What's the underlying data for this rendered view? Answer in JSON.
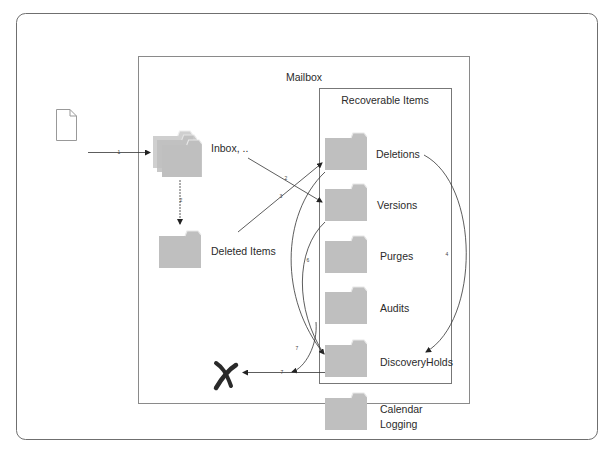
{
  "diagram": {
    "containers": {
      "mailbox": {
        "title": "Mailbox"
      },
      "recoverable_items": {
        "title": "Recoverable Items"
      }
    },
    "nodes": {
      "message": {
        "icon": "document-icon"
      },
      "inbox": {
        "label": "Inbox, ..",
        "icon": "folder-stack-icon"
      },
      "deleted_items": {
        "label": "Deleted Items",
        "icon": "folder-icon"
      },
      "deletions": {
        "label": "Deletions",
        "icon": "folder-icon"
      },
      "versions": {
        "label": "Versions",
        "icon": "folder-icon"
      },
      "purges": {
        "label": "Purges",
        "icon": "folder-icon"
      },
      "audits": {
        "label": "Audits",
        "icon": "folder-icon"
      },
      "discovery_holds": {
        "label": "DiscoveryHolds",
        "icon": "folder-icon"
      },
      "calendar_logging": {
        "label_line1": "Calendar",
        "label_line2": "Logging",
        "icon": "folder-icon"
      },
      "purged": {
        "icon": "x-mark-icon"
      }
    },
    "edges": [
      {
        "id": "e1",
        "from": "message",
        "to": "inbox",
        "label": "1"
      },
      {
        "id": "e2",
        "from": "inbox",
        "to": "deleted_items",
        "label": "2"
      },
      {
        "id": "e3",
        "from": "inbox",
        "to": "versions",
        "label": "2"
      },
      {
        "id": "e4",
        "from": "deleted_items",
        "to": "deletions",
        "label": "3"
      },
      {
        "id": "e5",
        "from": "deletions",
        "to": "discovery_holds",
        "label": "4"
      },
      {
        "id": "e6",
        "from": "versions",
        "to": "discovery_holds",
        "label": "6"
      },
      {
        "id": "e7",
        "from": "deletions",
        "to": "purged",
        "label": "7"
      },
      {
        "id": "e8",
        "from": "discovery_holds",
        "to": "purged",
        "label": "7"
      }
    ],
    "colors": {
      "folder_fill": "#bfbfbf",
      "line": "#333333",
      "frame": "#7f7f7f"
    }
  }
}
